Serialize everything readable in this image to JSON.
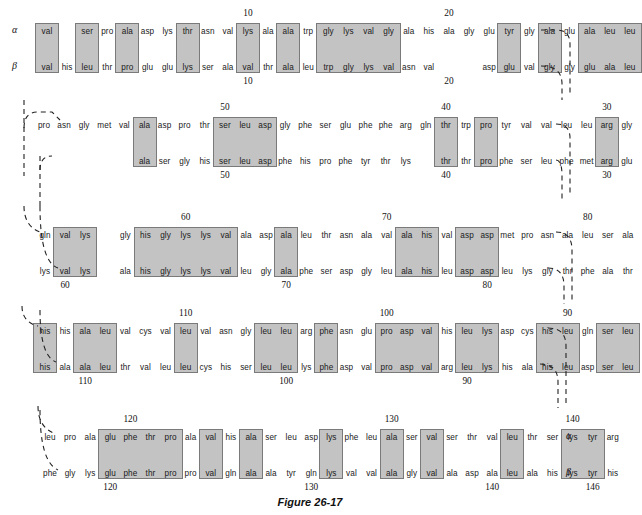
{
  "figure": {
    "caption": "Figure 26-17",
    "chain_labels": {
      "alpha": "α",
      "beta": "β"
    }
  },
  "layout": {
    "cell_width": 20.2,
    "rows": 5,
    "alpha_top": [
      26,
      120,
      230,
      326,
      432
    ],
    "beta_top": [
      62,
      156,
      266,
      362,
      468
    ],
    "box_color": "#c3c3c3",
    "box_border": "#7a7a7a"
  },
  "blocks": [
    {
      "id": "block-1",
      "x0": 30,
      "alpha": [
        "val",
        "leu",
        "ser",
        "pro",
        "ala",
        "asp",
        "lys",
        "thr",
        "asn",
        "val",
        "lys",
        "ala",
        "ala",
        "trp",
        "gly",
        "lys",
        "val",
        "gly",
        "ala",
        "his",
        "ala",
        "gly",
        "glu",
        "tyr",
        "gly",
        "ala",
        "glu",
        "ala",
        "leu"
      ],
      "beta": [
        "val",
        "his",
        "leu",
        "thr",
        "pro",
        "glu",
        "glu",
        "lys",
        "ser",
        "ala",
        "val",
        "thr",
        "ala",
        "leu",
        "trp",
        "gly",
        "lys",
        "val",
        "asn",
        "val",
        "",
        "",
        "asp",
        "glu",
        "val",
        "gly",
        "gly",
        "glu",
        "ala",
        "leu"
      ],
      "alpha_boxes": [
        [
          0,
          0
        ],
        [
          2,
          2
        ],
        [
          4,
          4
        ],
        [
          7,
          7
        ],
        [
          10,
          10
        ],
        [
          12,
          12
        ],
        [
          14,
          17
        ],
        [
          23,
          23
        ],
        [
          25,
          25
        ],
        [
          27,
          29
        ]
      ],
      "beta_boxes": [
        [
          0,
          0
        ],
        [
          2,
          2
        ],
        [
          4,
          4
        ],
        [
          7,
          7
        ],
        [
          10,
          10
        ],
        [
          12,
          12
        ],
        [
          14,
          17
        ],
        [
          23,
          23
        ],
        [
          25,
          25
        ],
        [
          27,
          29
        ]
      ],
      "alpha_numbers": [
        {
          "label": "10",
          "index": 10
        },
        {
          "label": "20",
          "index": 20
        }
      ],
      "beta_numbers": [
        {
          "label": "10",
          "index": 10
        },
        {
          "label": "20",
          "index": 20
        }
      ]
    },
    {
      "id": "block-2",
      "alpha": [
        "pro",
        "asn",
        "gly",
        "met",
        "val",
        "ala",
        "asp",
        "pro",
        "thr",
        "ser",
        "leu",
        "asp",
        "gly",
        "phe",
        "ser",
        "glu",
        "phe",
        "phe",
        "arg",
        "gln",
        "thr",
        "trp",
        "pro",
        "tyr",
        "val",
        "val",
        "leu",
        "leu",
        "arg",
        "gly"
      ],
      "beta": [
        "ala",
        "ser",
        "gly",
        "his",
        "ser",
        "leu",
        "asp",
        "phe",
        "his",
        "pro",
        "phe",
        "tyr",
        "thr",
        "lys",
        "thr",
        "thr",
        "pro",
        "phe",
        "ser",
        "leu",
        "phe",
        "met",
        "arg",
        "glu"
      ],
      "numbers_alpha": [
        {
          "label": "50"
        },
        {
          "label": "40"
        },
        {
          "label": "30"
        }
      ],
      "numbers_beta": [
        {
          "label": "50"
        },
        {
          "label": "40"
        },
        {
          "label": "30"
        }
      ]
    },
    {
      "id": "block-3",
      "alpha": [
        "gln",
        "val",
        "lys",
        "gly",
        "his",
        "gly",
        "lys",
        "lys",
        "val",
        "ala",
        "asp",
        "ala",
        "leu",
        "thr",
        "asn",
        "ala",
        "val",
        "ala",
        "his",
        "val",
        "asp",
        "asp",
        "met",
        "pro",
        "asn",
        "ala",
        "leu",
        "ser",
        "ala"
      ],
      "beta": [
        "lys",
        "val",
        "lys",
        "ala",
        "his",
        "gly",
        "lys",
        "lys",
        "val",
        "leu",
        "gly",
        "ala",
        "phe",
        "ser",
        "asp",
        "gly",
        "leu",
        "ala",
        "his",
        "leu",
        "asp",
        "asp",
        "leu",
        "lys",
        "gly",
        "thr",
        "phe",
        "ala",
        "thr"
      ],
      "numbers_alpha": [
        {
          "label": "60"
        },
        {
          "label": "70"
        },
        {
          "label": "80"
        }
      ],
      "numbers_beta": [
        {
          "label": "60"
        },
        {
          "label": "70"
        },
        {
          "label": "80"
        }
      ]
    },
    {
      "id": "block-4",
      "alpha": [
        "his",
        "his",
        "ala",
        "leu",
        "val",
        "cys",
        "val",
        "leu",
        "val",
        "asn",
        "gly",
        "leu",
        "leu",
        "arg",
        "phe",
        "asn",
        "glu",
        "pro",
        "asp",
        "val",
        "his",
        "leu",
        "lys",
        "asp",
        "cys",
        "his",
        "leu",
        "gln",
        "ser",
        "leu"
      ],
      "beta": [
        "his",
        "ala",
        "ala",
        "leu",
        "thr",
        "val",
        "leu",
        "leu",
        "cys",
        "his",
        "ser",
        "leu",
        "leu",
        "lys",
        "phe",
        "asp",
        "val",
        "pro",
        "asp",
        "val",
        "arg",
        "leu",
        "lys",
        "his",
        "ala",
        "his",
        "leu",
        "asp",
        "ser",
        "leu"
      ],
      "numbers_alpha": [
        {
          "label": "110"
        },
        {
          "label": "100"
        },
        {
          "label": "90"
        }
      ],
      "numbers_beta": [
        {
          "label": "110"
        },
        {
          "label": "100"
        },
        {
          "label": "90"
        }
      ]
    },
    {
      "id": "block-5",
      "alpha": [
        "leu",
        "pro",
        "ala",
        "glu",
        "phe",
        "thr",
        "pro",
        "ala",
        "val",
        "his",
        "ala",
        "ser",
        "leu",
        "asp",
        "lys",
        "phe",
        "leu",
        "ala",
        "ser",
        "val",
        "ser",
        "thr",
        "val",
        "leu",
        "thr",
        "ser",
        "lys",
        "tyr",
        "arg"
      ],
      "beta": [
        "phe",
        "gly",
        "lys",
        "glu",
        "phe",
        "thr",
        "pro",
        "pro",
        "val",
        "gln",
        "ala",
        "ala",
        "tyr",
        "gln",
        "lys",
        "val",
        "val",
        "ala",
        "gly",
        "val",
        "ala",
        "asp",
        "ala",
        "leu",
        "ala",
        "his",
        "lys",
        "tyr",
        "his"
      ],
      "numbers_alpha": [
        {
          "label": "120"
        },
        {
          "label": "130"
        },
        {
          "label": "140"
        }
      ],
      "numbers_beta": [
        {
          "label": "120"
        },
        {
          "label": "130"
        },
        {
          "label": "140"
        },
        {
          "label": "146"
        }
      ]
    }
  ],
  "row_numbers": {
    "r1_alpha": [
      "10",
      "20"
    ],
    "r1_beta": [
      "10",
      "20"
    ],
    "r2_alpha": [
      "50",
      "40",
      "30"
    ],
    "r2_beta": [
      "50",
      "40",
      "30"
    ],
    "r3_alpha": [
      "60",
      "70",
      "80"
    ],
    "r3_beta": [
      "60",
      "70",
      "80"
    ],
    "r4_alpha": [
      "110",
      "100",
      "90"
    ],
    "r4_beta": [
      "110",
      "100",
      "90"
    ],
    "r5_alpha": [
      "120",
      "130",
      "140"
    ],
    "r5_beta": [
      "120",
      "130",
      "140",
      "146"
    ]
  },
  "text_cells": {
    "r1a": [
      {
        "t": "val",
        "x": 38,
        "b": 1
      },
      {
        "t": "leu",
        "x": 78,
        "b": 1
      },
      {
        "t": "ser",
        "x": 98,
        "b": 0
      },
      {
        "t": "pro",
        "x": 118,
        "b": 1
      },
      {
        "t": "ala",
        "x": 138,
        "b": 0
      },
      {
        "t": "asp",
        "x": 158,
        "b": 0
      },
      {
        "t": "lys",
        "x": 178,
        "b": 1
      },
      {
        "t": "thr",
        "x": 198,
        "b": 0
      },
      {
        "t": "asn",
        "x": 218,
        "b": 0
      },
      {
        "t": "val",
        "x": 238,
        "b": 1
      },
      {
        "t": "lys",
        "x": 258,
        "b": 0
      },
      {
        "t": "ala",
        "x": 278,
        "b": 1
      },
      {
        "t": "ala",
        "x": 298,
        "b": 0
      },
      {
        "t": "trp",
        "x": 318,
        "b": 1
      },
      {
        "t": "gly",
        "x": 338,
        "b": 1
      },
      {
        "t": "lys",
        "x": 358,
        "b": 1
      },
      {
        "t": "val",
        "x": 378,
        "b": 1
      },
      {
        "t": "gly",
        "x": 398,
        "b": 0
      },
      {
        "t": "ala",
        "x": 418,
        "b": 0
      },
      {
        "t": "his",
        "x": 438,
        "b": 0
      },
      {
        "t": "ala",
        "x": 458,
        "b": 0
      },
      {
        "t": "gly",
        "x": 478,
        "b": 0
      },
      {
        "t": "glu",
        "x": 498,
        "b": 1
      },
      {
        "t": "tyr",
        "x": 518,
        "b": 0
      },
      {
        "t": "gly",
        "x": 538,
        "b": 1
      },
      {
        "t": "ala",
        "x": 558,
        "b": 0
      },
      {
        "t": "glu",
        "x": 578,
        "b": 1
      },
      {
        "t": "ala",
        "x": 598,
        "b": 1
      },
      {
        "t": "leu",
        "x": 618,
        "b": 1
      }
    ]
  },
  "colors": {
    "background": "#ffffff",
    "residue_text": "#1a1a1a",
    "highlight_fill": "#c3c3c3",
    "highlight_stroke": "#7a7a7a",
    "connector": "#222222"
  }
}
